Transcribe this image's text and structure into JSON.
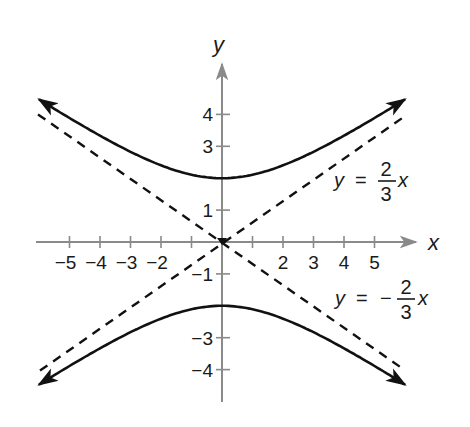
{
  "chart_data": {
    "type": "line",
    "title": "",
    "xlabel": "x",
    "ylabel": "y",
    "xlim": [
      -6,
      6
    ],
    "ylim": [
      -5.2,
      5.8
    ],
    "grid": false,
    "x_ticks": [
      -5,
      -4,
      -3,
      -2,
      -1,
      1,
      2,
      3,
      4,
      5
    ],
    "x_tick_labels": [
      "−5",
      "−4",
      "−3",
      "−2",
      "",
      "",
      "2",
      "3",
      "4",
      "5"
    ],
    "y_ticks": [
      -4,
      -3,
      -1,
      1,
      3,
      4
    ],
    "y_tick_labels": [
      "−4",
      "−3",
      "−1",
      "1",
      "3",
      "4"
    ],
    "series": [
      {
        "name": "upper branch",
        "style": "solid",
        "equation": "y = 2*sqrt(1 + x^2/9)",
        "x": [
          -6,
          -5,
          -4,
          -3,
          -2,
          -1,
          0,
          1,
          2,
          3,
          4,
          5,
          6
        ],
        "values": [
          4.47,
          3.89,
          3.33,
          2.83,
          2.4,
          2.11,
          2.0,
          2.11,
          2.4,
          2.83,
          3.33,
          3.89,
          4.47
        ]
      },
      {
        "name": "lower branch",
        "style": "solid",
        "equation": "y = -2*sqrt(1 + x^2/9)",
        "x": [
          -6,
          -5,
          -4,
          -3,
          -2,
          -1,
          0,
          1,
          2,
          3,
          4,
          5,
          6
        ],
        "values": [
          -4.47,
          -3.89,
          -3.33,
          -2.83,
          -2.4,
          -2.11,
          -2.0,
          -2.11,
          -2.4,
          -2.83,
          -3.33,
          -3.89,
          -4.47
        ]
      },
      {
        "name": "asymptote y = 2/3 x",
        "style": "dashed",
        "x": [
          -6,
          6
        ],
        "values": [
          -4,
          4
        ]
      },
      {
        "name": "asymptote y = -2/3 x",
        "style": "dashed",
        "x": [
          -6,
          6
        ],
        "values": [
          4,
          -4
        ]
      }
    ],
    "annotations": [
      {
        "text": "y = 2/3 x",
        "y_part": "y",
        "eq": "=",
        "sign": "",
        "num": "2",
        "den": "3",
        "var": "x",
        "near": [
          5,
          2
        ]
      },
      {
        "text": "y = −2/3 x",
        "y_part": "y",
        "eq": "=",
        "sign": "−",
        "num": "2",
        "den": "3",
        "var": "x",
        "near": [
          5,
          -2
        ]
      }
    ]
  },
  "colors": {
    "axis": "#8a8a8a",
    "curve": "#111111",
    "text": "#1a1a1a",
    "background": "#ffffff"
  }
}
